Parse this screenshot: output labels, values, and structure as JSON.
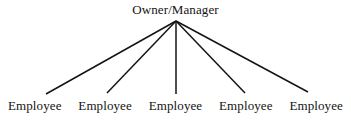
{
  "diagram": {
    "type": "organizational-chart",
    "orientation": "top-down",
    "background_color": "#ffffff",
    "line_color": "#141414",
    "text_color": "#141414",
    "root": {
      "label": "Owner/Manager"
    },
    "leaves": [
      {
        "label": "Employee"
      },
      {
        "label": "Employee"
      },
      {
        "label": "Employee"
      },
      {
        "label": "Employee"
      },
      {
        "label": "Employee"
      }
    ],
    "connectors": {
      "apex": {
        "x": 176,
        "y": 21
      },
      "endpoints": [
        {
          "x": 46,
          "y": 94
        },
        {
          "x": 107,
          "y": 93
        },
        {
          "x": 176,
          "y": 94
        },
        {
          "x": 245,
          "y": 93
        },
        {
          "x": 308,
          "y": 92
        }
      ],
      "stroke_width": 1.5
    }
  }
}
